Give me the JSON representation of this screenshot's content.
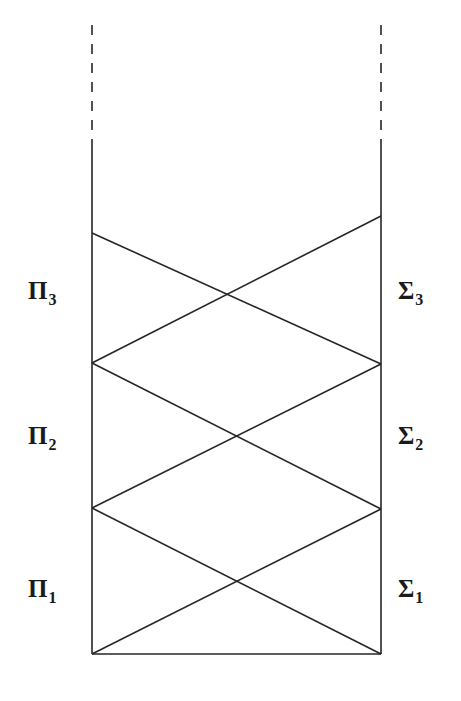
{
  "figure": {
    "kind": "arithmetical-hierarchy-diagram",
    "background_color": "#ffffff",
    "stroke_color": "#262626",
    "text_color": "#1a1a1a",
    "width": 461,
    "height": 701
  },
  "labels": {
    "left": [
      {
        "name": "pi-3",
        "base": "Π",
        "sub": "3",
        "x": 28,
        "y": 278
      },
      {
        "name": "pi-2",
        "base": "Π",
        "sub": "2",
        "x": 28,
        "y": 423
      },
      {
        "name": "pi-1",
        "base": "Π",
        "sub": "1",
        "x": 28,
        "y": 576
      }
    ],
    "right": [
      {
        "name": "sigma-3",
        "base": "Σ",
        "sub": "3",
        "x": 398,
        "y": 278
      },
      {
        "name": "sigma-2",
        "base": "Σ",
        "sub": "2",
        "x": 398,
        "y": 423
      },
      {
        "name": "sigma-1",
        "base": "Σ",
        "sub": "1",
        "x": 398,
        "y": 576
      }
    ]
  },
  "chart_data": {
    "type": "diagram",
    "title": "",
    "xlabel": "",
    "ylabel": "",
    "rails": {
      "left_x": 92,
      "right_x": 381,
      "solid_top_y": 144,
      "bottom_y": 654,
      "dashed_top_y": 25,
      "dashed_bottom_y": 144
    },
    "nodes": [
      {
        "id": "L0",
        "side": "left",
        "x": 92,
        "y": 654
      },
      {
        "id": "L1",
        "side": "left",
        "x": 92,
        "y": 508
      },
      {
        "id": "L2",
        "side": "left",
        "x": 92,
        "y": 363
      },
      {
        "id": "L3",
        "side": "left",
        "x": 92,
        "y": 233
      },
      {
        "id": "R0",
        "side": "right",
        "x": 381,
        "y": 654
      },
      {
        "id": "R1",
        "side": "right",
        "x": 381,
        "y": 509
      },
      {
        "id": "R2",
        "side": "right",
        "x": 381,
        "y": 364
      },
      {
        "id": "R3",
        "side": "right",
        "x": 381,
        "y": 216
      }
    ],
    "edges": [
      {
        "from": "L0",
        "to": "R1",
        "kind": "diagonal"
      },
      {
        "from": "R0",
        "to": "L1",
        "kind": "diagonal"
      },
      {
        "from": "L1",
        "to": "R2",
        "kind": "diagonal"
      },
      {
        "from": "R1",
        "to": "L2",
        "kind": "diagonal"
      },
      {
        "from": "L2",
        "to": "R3",
        "kind": "diagonal"
      },
      {
        "from": "R2",
        "to": "L3",
        "kind": "diagonal"
      },
      {
        "from": "L0",
        "to": "R0",
        "kind": "horizontal"
      }
    ],
    "bands": [
      {
        "index": 1,
        "left_label": "Π₁",
        "right_label": "Σ₁",
        "top_y": 508,
        "bottom_y": 654
      },
      {
        "index": 2,
        "left_label": "Π₂",
        "right_label": "Σ₂",
        "top_y": 363,
        "bottom_y": 508
      },
      {
        "index": 3,
        "left_label": "Π₃",
        "right_label": "Σ₃",
        "top_y": 216,
        "bottom_y": 363
      }
    ],
    "dash_pattern": "10 9",
    "stroke_width": 1.6,
    "grid": false,
    "legend": null
  }
}
